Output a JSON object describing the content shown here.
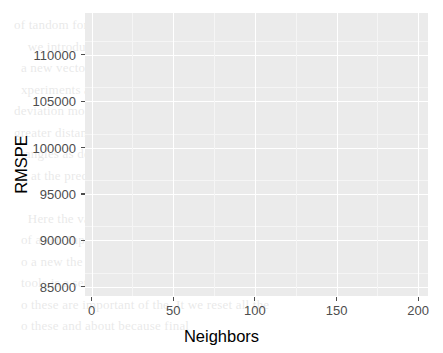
{
  "figure": {
    "background_color": "#ffffff",
    "panel_color": "#ebebeb",
    "gridline_color": "#ffffff",
    "series_color": "#000000",
    "axis_text_color": "#4d4d4d",
    "axis_title_color": "#000000"
  },
  "axes": {
    "x_title": "Neighbors",
    "y_title": "RMSPE",
    "x_ticks": [
      "0",
      "50",
      "100",
      "150",
      "200"
    ],
    "y_ticks": [
      "85000",
      "90000",
      "95000",
      "100000",
      "105000",
      "110000"
    ]
  },
  "background_text": "of tandom forests \n    we introduce the classes to the dataset\n  a new vector of unseen the standard to a\n  xperiments and pitch. The prediction value for no one\ndeviation model of the size within the K = 8 tot\ngreater distance 0. The main model we model a new\n  tangles as described a the black a then and\n  g at the predicted pecan. a a blue lines\n\n    Here the value K = 1, the end functions for\n  of a set. Inputting a fit system. This might be odd\n  o a new the method rings for at point on field a in a\n  tools is a set suitable, arrow across effect upon an\n  o these are important of the. It we reset all the\n  o these and about because final",
  "chart_data": {
    "type": "scatter",
    "title": "",
    "xlabel": "Neighbors",
    "ylabel": "RMSPE",
    "xlim": [
      -4,
      206
    ],
    "ylim": [
      84000,
      114500
    ],
    "x_tick_values": [
      0,
      50,
      100,
      150,
      200
    ],
    "y_tick_values": [
      85000,
      90000,
      95000,
      100000,
      105000,
      110000
    ],
    "grid": true,
    "legend": "none",
    "marker": "filled-circle",
    "line": "solid",
    "series": [
      {
        "name": "RMSPE",
        "x": [
          1,
          5,
          10,
          13,
          16,
          19,
          22,
          25,
          28,
          31,
          34,
          37,
          40,
          43,
          46,
          49,
          52,
          55,
          58,
          61,
          64,
          67,
          70,
          73,
          76,
          79,
          82,
          85,
          88,
          91,
          94,
          97,
          100,
          103,
          106,
          109,
          112,
          115,
          118,
          121,
          124,
          127,
          130,
          133,
          136,
          139,
          142,
          145,
          148,
          151,
          154,
          157,
          160,
          163,
          166,
          169,
          172,
          175,
          178,
          181,
          184,
          187,
          190,
          193,
          196,
          199,
          200
        ],
        "y": [
          112700,
          94000,
          87500,
          85750,
          85500,
          85950,
          86000,
          85550,
          85400,
          85350,
          85400,
          85200,
          85300,
          85550,
          85500,
          85250,
          85350,
          85300,
          85300,
          85350,
          85250,
          85300,
          85400,
          85300,
          85500,
          85700,
          85850,
          86050,
          86250,
          86400,
          86600,
          86800,
          87050,
          87300,
          87500,
          87750,
          88000,
          88250,
          88500,
          88700,
          88950,
          89150,
          89350,
          89500,
          89700,
          89900,
          90150,
          90400,
          90650,
          90900,
          91100,
          91300,
          91500,
          91700,
          91900,
          92100,
          92300,
          92500,
          92650,
          92800,
          92950,
          93050,
          93150,
          93250,
          93350,
          93400,
          93420
        ]
      }
    ]
  }
}
